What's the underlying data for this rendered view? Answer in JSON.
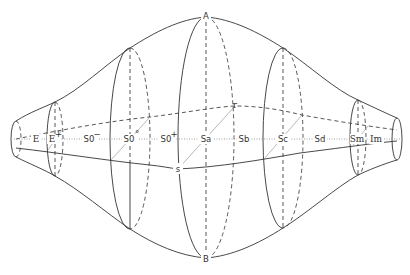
{
  "diagram": {
    "title": "",
    "colors": {
      "line": "#333333",
      "dashed": "#444444",
      "axis_dotted": "#888888",
      "background": "#ffffff"
    },
    "poles": {
      "top": "A",
      "bottom": "B"
    },
    "points": {
      "r": "r",
      "s": "s"
    },
    "sequence_labels": [
      {
        "id": "E",
        "label": "E",
        "sup": ""
      },
      {
        "id": "E+",
        "label": "E",
        "sup": "+"
      },
      {
        "id": "S0-",
        "label": "S0",
        "sup": "−"
      },
      {
        "id": "S0o",
        "label": "S0",
        "sup": "°"
      },
      {
        "id": "S0+",
        "label": "S0",
        "sup": "+"
      },
      {
        "id": "Sa",
        "label": "Sa",
        "sup": ""
      },
      {
        "id": "Sb",
        "label": "Sb",
        "sup": ""
      },
      {
        "id": "Sc",
        "label": "Sc",
        "sup": ""
      },
      {
        "id": "Sd",
        "label": "Sd",
        "sup": ""
      },
      {
        "id": "Sm",
        "label": "Sm",
        "sup": ""
      },
      {
        "id": "Im",
        "label": "Im",
        "sup": ""
      }
    ],
    "cross_sections": [
      "left-cap",
      "E+",
      "S0o",
      "Sa",
      "Sc",
      "Sm",
      "right-cap"
    ]
  }
}
